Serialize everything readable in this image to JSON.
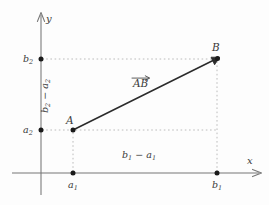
{
  "figure": {
    "type": "vector-diagram",
    "background_color": "#fdfdfd",
    "axis_color": "#6f6f6f",
    "guide_color": "#b9b9b9",
    "vector_color": "#262626",
    "text_color": "#3a3a3a",
    "point_color": "#1a1a1a"
  },
  "axes": {
    "x_axis": {
      "name": "x",
      "origin_px": 41,
      "baseline_px": 173,
      "start_px": 12,
      "end_px": 262,
      "arrow": "right"
    },
    "y_axis": {
      "name": "y",
      "origin_px": 173,
      "baseline_px": 41,
      "start_px": 195,
      "end_px": 12,
      "arrow": "up"
    }
  },
  "points": [
    {
      "id": "A",
      "label": "A",
      "x_px": 73,
      "y_px": 130,
      "x_tick_label_main": "a",
      "x_tick_label_sub": "1",
      "y_tick_label_main": "a",
      "y_tick_label_sub": "2"
    },
    {
      "id": "B",
      "label": "B",
      "x_px": 217,
      "y_px": 59,
      "x_tick_label_main": "b",
      "x_tick_label_sub": "1",
      "y_tick_label_main": "b",
      "y_tick_label_sub": "2"
    }
  ],
  "vector": {
    "label_letters": "AB",
    "label_accent": "arrow-over",
    "from": "A",
    "to": "B"
  },
  "annotations": {
    "horizontal_difference": {
      "main_1": "b",
      "sub_1": "1",
      "operator": "−",
      "main_2": "a",
      "sub_2": "1",
      "position": "above-x-axis"
    },
    "vertical_difference": {
      "main_1": "b",
      "sub_1": "2",
      "operator": "−",
      "main_2": "a",
      "sub_2": "2",
      "position": "right-of-y-axis-rotated"
    }
  },
  "tick_labels": {
    "x_a1_main": "a",
    "x_a1_sub": "1",
    "x_b1_main": "b",
    "x_b1_sub": "1",
    "y_a2_main": "a",
    "y_a2_sub": "2",
    "y_b2_main": "b",
    "y_b2_sub": "2"
  }
}
